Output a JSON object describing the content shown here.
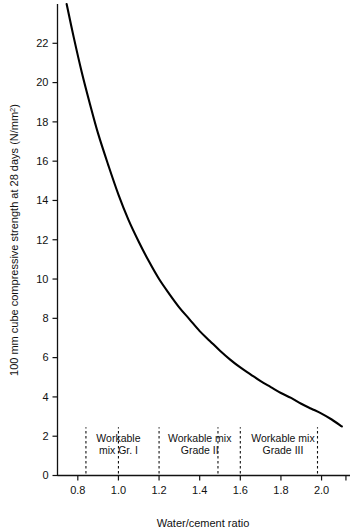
{
  "chart_data": {
    "type": "line",
    "title": "",
    "subtitle": "",
    "xlabel": "Water/cement ratio",
    "ylabel": "100 mm cube compressive strength at 28 days (N/mm²)",
    "ylabel_main": "100 mm cube compressive strength at 28 days (N/mm",
    "ylabel_sup": "2",
    "ylabel_tail": ")",
    "xlim": [
      0.7,
      2.14
    ],
    "ylim": [
      0,
      24
    ],
    "grid": false,
    "legend": "none",
    "xticks": [
      0.8,
      1.0,
      1.2,
      1.4,
      1.6,
      1.8,
      2.0
    ],
    "xtick_labels": [
      "0.8",
      "1.0",
      "1.2",
      "1.4",
      "1.6",
      "1.8",
      "2.0"
    ],
    "xticks_minor": [
      2.12
    ],
    "yticks": [
      0,
      2,
      4,
      6,
      8,
      10,
      12,
      14,
      16,
      18,
      20,
      22
    ],
    "ytick_labels": [
      "0",
      "2",
      "4",
      "6",
      "8",
      "10",
      "12",
      "14",
      "16",
      "18",
      "20",
      "22"
    ],
    "series": [
      {
        "name": "Compressive strength vs water/cement ratio",
        "x": [
          0.745,
          0.78,
          0.82,
          0.86,
          0.9,
          0.95,
          1.0,
          1.05,
          1.1,
          1.15,
          1.2,
          1.25,
          1.3,
          1.35,
          1.4,
          1.45,
          1.5,
          1.55,
          1.6,
          1.65,
          1.7,
          1.75,
          1.8,
          1.85,
          1.9,
          1.95,
          2.0,
          2.05,
          2.1
        ],
        "y": [
          24.0,
          22.3,
          20.5,
          18.9,
          17.4,
          15.8,
          14.3,
          13.0,
          11.9,
          10.9,
          10.0,
          9.25,
          8.55,
          7.95,
          7.35,
          6.85,
          6.35,
          5.9,
          5.5,
          5.15,
          4.8,
          4.5,
          4.2,
          3.95,
          3.65,
          3.4,
          3.15,
          2.85,
          2.5
        ]
      }
    ],
    "annotations": [
      {
        "id": "workable-mix-gr-1",
        "line1": "Workable",
        "line2": "mix Gr. I",
        "text_x": 1.0,
        "guide_lines": [
          0.84,
          1.0
        ]
      },
      {
        "id": "workable-mix-grade-2",
        "line1": "Workable mix",
        "line2": "Grade II",
        "text_x": 1.4,
        "guide_lines": [
          1.2,
          1.49
        ]
      },
      {
        "id": "workable-mix-grade-3",
        "line1": "Workable mix",
        "line2": "Grade III",
        "text_x": 1.81,
        "guide_lines": [
          1.6,
          1.98
        ]
      }
    ],
    "colors": {
      "curve": "#000000",
      "axis": "#111111",
      "background": "#ffffff",
      "text": "#111111"
    }
  }
}
